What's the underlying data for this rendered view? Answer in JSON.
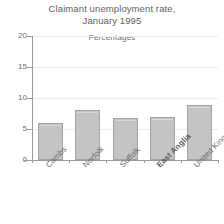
{
  "chart_data": {
    "type": "bar",
    "title": "Claimant unemployment rate, January 1995",
    "title_lines": [
      "Claimant unemployment rate,",
      "January 1995"
    ],
    "subtitle": "Percentages",
    "xlabel": "",
    "ylabel": "",
    "categories": [
      "Cambs",
      "Norfolk",
      "Suffolk",
      "East Anglia",
      "United Kingdom"
    ],
    "values": [
      6.0,
      8.0,
      6.7,
      7.0,
      8.8
    ],
    "ylim": [
      0,
      20
    ],
    "yticks": [
      0,
      5,
      10,
      15,
      20
    ],
    "ytick_labels": [
      "0",
      "5",
      "10",
      "15",
      "20"
    ],
    "grid": true,
    "legend": false,
    "legend_position": "none",
    "emphasized_categories": [
      "East Anglia"
    ],
    "bar_fill_color": "#c4c4c4",
    "bar_border_color": "#a3a3a3",
    "gridline_color": "#ececec",
    "axis_color": "#9a9a9a",
    "text_color": "#6b6b6b"
  }
}
